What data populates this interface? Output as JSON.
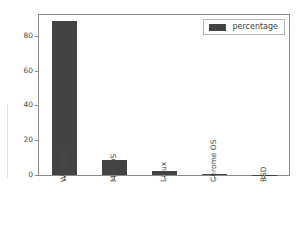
{
  "chart_data": {
    "type": "bar",
    "title": "",
    "xlabel": "",
    "ylabel": "",
    "categories": [
      "Windows",
      "Mac OS",
      "Linux",
      "Chrome OS",
      "BSD"
    ],
    "values": [
      88.7,
      8.5,
      2.2,
      0.4,
      0.1
    ],
    "series": [
      {
        "name": "percentage",
        "values": [
          88.7,
          8.5,
          2.2,
          0.4,
          0.1
        ],
        "color": "#434343"
      }
    ],
    "ylim": [
      0,
      92
    ],
    "yticks": [
      0,
      20,
      40,
      60,
      80
    ],
    "ytick_labels": [
      "0",
      "20",
      "40",
      "60",
      "80"
    ],
    "grid": false,
    "legend": {
      "position": "upper right",
      "entries": [
        {
          "label": "percentage",
          "color": "#434343",
          "swatch": "legend-swatch-percentage"
        }
      ]
    },
    "axis_color": "#8a8a8a",
    "tick_label_color": "#4a4a4a",
    "background": "#ffffff",
    "xtick_rotation": -90
  }
}
